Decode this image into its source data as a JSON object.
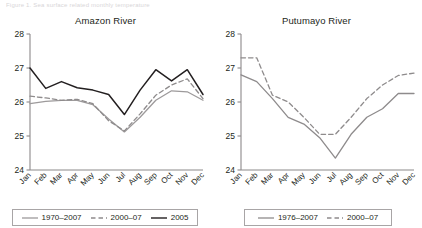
{
  "figure": {
    "caption_strip": "Figure 1. Sea surface related monthly temperature",
    "axis_color": "#8c898a",
    "colors": {
      "baseline": "#9d9a9b",
      "recent": "#8e8b8c",
      "event": "#231f20",
      "axis": "#8c898a",
      "text": "#231f20"
    }
  },
  "panels": [
    {
      "id": "amazon",
      "title": "Amazon River",
      "legend": [
        {
          "label": "1970–2007",
          "style": "solid",
          "color": "#9d9a9b"
        },
        {
          "label": "2000–07",
          "style": "dashed",
          "color": "#8e8b8c"
        },
        {
          "label": "2005",
          "style": "solid",
          "color": "#231f20"
        }
      ]
    },
    {
      "id": "putumayo",
      "title": "Putumayo River",
      "legend": [
        {
          "label": "1976–2007",
          "style": "solid",
          "color": "#8e8b8c"
        },
        {
          "label": "2000–07",
          "style": "dashed",
          "color": "#8e8b8c"
        }
      ]
    }
  ],
  "chart_data": [
    {
      "type": "line",
      "id": "amazon",
      "title": "Amazon River",
      "xlabel": "",
      "ylabel": "",
      "ylim": [
        24,
        28
      ],
      "yticks": [
        24,
        25,
        26,
        27,
        28
      ],
      "grid": false,
      "legend_position": "bottom",
      "categories": [
        "Jan",
        "Feb",
        "Mar",
        "Apr",
        "May",
        "Jun",
        "Jul",
        "Aug",
        "Sep",
        "Oct",
        "Nov",
        "Dec"
      ],
      "series": [
        {
          "name": "1970–2007",
          "style": "solid",
          "color": "#9d9a9b",
          "values": [
            25.95,
            26.02,
            26.05,
            26.05,
            25.92,
            25.5,
            25.12,
            25.55,
            26.05,
            26.33,
            26.3,
            26.05
          ]
        },
        {
          "name": "2000–07",
          "style": "dashed",
          "color": "#8e8b8c",
          "values": [
            26.17,
            26.12,
            26.05,
            26.08,
            25.95,
            25.45,
            25.15,
            25.65,
            26.2,
            26.5,
            26.68,
            26.1
          ]
        },
        {
          "name": "2005",
          "style": "solid",
          "color": "#231f20",
          "values": [
            27.0,
            26.4,
            26.6,
            26.42,
            26.35,
            26.22,
            25.63,
            26.35,
            26.95,
            26.62,
            26.95,
            26.22
          ]
        }
      ]
    },
    {
      "type": "line",
      "id": "putumayo",
      "title": "Putumayo River",
      "xlabel": "",
      "ylabel": "",
      "ylim": [
        24,
        28
      ],
      "yticks": [
        24,
        25,
        26,
        27,
        28
      ],
      "grid": false,
      "legend_position": "bottom",
      "categories": [
        "Jan",
        "Feb",
        "Mar",
        "Apr",
        "May",
        "Jun",
        "Jul",
        "Aug",
        "Sep",
        "Oct",
        "Nov",
        "Dec"
      ],
      "series": [
        {
          "name": "1976–2007",
          "style": "solid",
          "color": "#8e8b8c",
          "values": [
            26.8,
            26.6,
            26.1,
            25.55,
            25.35,
            24.95,
            24.35,
            25.05,
            25.55,
            25.8,
            26.25,
            26.25
          ]
        },
        {
          "name": "2000–07",
          "style": "dashed",
          "color": "#8e8b8c",
          "values": [
            27.3,
            27.3,
            26.2,
            26.0,
            25.55,
            25.05,
            25.05,
            25.55,
            26.1,
            26.5,
            26.78,
            26.85
          ]
        }
      ]
    }
  ]
}
